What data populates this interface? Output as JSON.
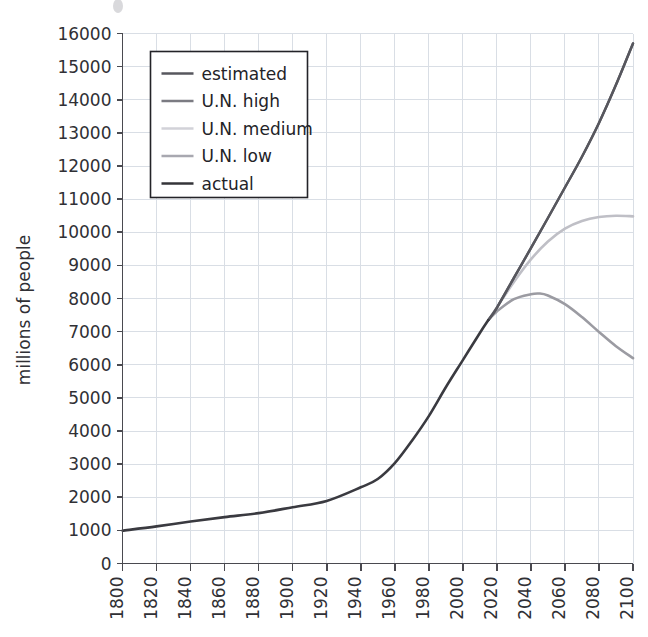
{
  "chart_data": {
    "type": "line",
    "title": "",
    "xlabel": "",
    "ylabel": "millions of people",
    "xlim": [
      1800,
      2100
    ],
    "ylim": [
      0,
      16000
    ],
    "grid": true,
    "legend_position": "top-left",
    "x_ticks": [
      1800,
      1820,
      1840,
      1860,
      1880,
      1900,
      1920,
      1940,
      1960,
      1980,
      2000,
      2020,
      2040,
      2060,
      2080,
      2100
    ],
    "y_ticks": [
      0,
      1000,
      2000,
      3000,
      4000,
      5000,
      6000,
      7000,
      8000,
      9000,
      10000,
      11000,
      12000,
      13000,
      14000,
      15000,
      16000
    ],
    "series": [
      {
        "name": "actual",
        "color": "#3a3a40",
        "x": [
          1800,
          1820,
          1840,
          1860,
          1880,
          1900,
          1920,
          1940,
          1950,
          1960,
          1970,
          1980,
          1990,
          2000,
          2010,
          2015
        ],
        "values": [
          990,
          1120,
          1270,
          1400,
          1520,
          1700,
          1890,
          2300,
          2550,
          3030,
          3700,
          4450,
          5320,
          6140,
          6960,
          7350
        ]
      },
      {
        "name": "estimated",
        "color": "#57575e",
        "x": [
          2015,
          2020,
          2030,
          2040,
          2050,
          2060,
          2070,
          2080,
          2090,
          2100
        ],
        "values": [
          7350,
          7720,
          8620,
          9520,
          10430,
          11350,
          12280,
          13300,
          14450,
          15700
        ]
      },
      {
        "name": "U.N. high",
        "color": "#57575e",
        "x": [
          2015,
          2020,
          2030,
          2040,
          2050,
          2060,
          2070,
          2080,
          2090,
          2100
        ],
        "values": [
          7350,
          7720,
          8620,
          9520,
          10430,
          11350,
          12280,
          13300,
          14450,
          15700
        ]
      },
      {
        "name": "U.N. medium",
        "color": "#bfbfc6",
        "x": [
          2015,
          2020,
          2030,
          2040,
          2050,
          2060,
          2070,
          2080,
          2090,
          2100
        ],
        "values": [
          7350,
          7730,
          8500,
          9180,
          9720,
          10110,
          10340,
          10460,
          10500,
          10480
        ]
      },
      {
        "name": "U.N. low",
        "color": "#9b9ba2",
        "x": [
          2015,
          2020,
          2030,
          2040,
          2045,
          2050,
          2060,
          2070,
          2080,
          2090,
          2100
        ],
        "values": [
          7350,
          7610,
          7980,
          8130,
          8150,
          8090,
          7830,
          7440,
          6990,
          6560,
          6200
        ]
      }
    ]
  },
  "axes": {
    "y_axis_label": "millions of people"
  },
  "legend": {
    "items": [
      {
        "label": "estimated",
        "color": "#57575e"
      },
      {
        "label": "U.N. high",
        "color": "#7b7b82"
      },
      {
        "label": "U.N. medium",
        "color": "#d2d2d8"
      },
      {
        "label": "U.N. low",
        "color": "#a8a8b0"
      },
      {
        "label": "actual",
        "color": "#343439"
      }
    ]
  }
}
